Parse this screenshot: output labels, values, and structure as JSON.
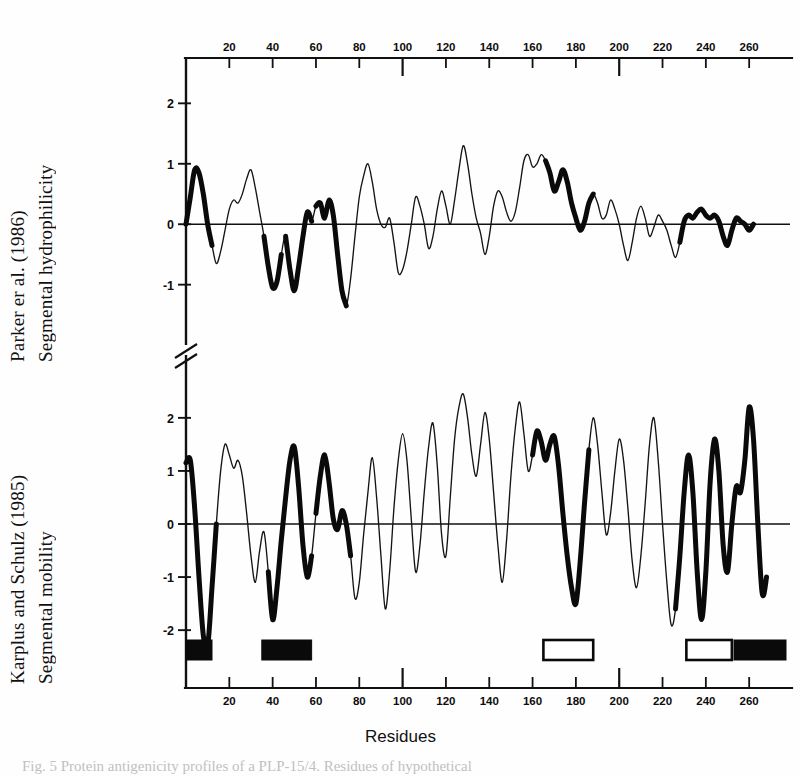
{
  "figure": {
    "xlabel": "Residues",
    "caption": "Fig. 5 Protein antigenicity profiles of a PLP-15/4. Residues of hypothetical",
    "panels": [
      {
        "id": "top",
        "title_line1": "Parker er al. (1986)",
        "title_line2": "Segmental hydrophilicity"
      },
      {
        "id": "bottom",
        "title_line1": "Karplus and Schulz (1985)",
        "title_line2": "Segmental mobility"
      }
    ]
  },
  "chart_data": {
    "type": "line",
    "title": "",
    "xlabel": "Residues",
    "xlim": [
      0,
      277
    ],
    "xticks": [
      20,
      40,
      60,
      80,
      100,
      120,
      140,
      160,
      180,
      200,
      220,
      240,
      260
    ],
    "xtick_labels": [
      "20",
      "40",
      "60",
      "80",
      "100",
      "120",
      "140",
      "160",
      "180",
      "200",
      "220",
      "240",
      "260"
    ],
    "major_xticks": [
      100,
      200
    ],
    "grid": false,
    "legend": "none",
    "axis_break": true,
    "panels": [
      {
        "name": "top",
        "ylabel": "Parker er al. (1986) Segmental hydrophilicity",
        "ylim": [
          -1.75,
          2.75
        ],
        "yticks": [
          -1,
          0,
          1,
          2
        ],
        "ytick_labels": [
          "-1",
          "0",
          "1",
          "2"
        ],
        "zero_line": 0,
        "series": [
          {
            "name": "segmental-hydrophilicity",
            "x": [
              0,
              2,
              4,
              6,
              8,
              10,
              12,
              14,
              16,
              18,
              20,
              22,
              24,
              26,
              28,
              30,
              32,
              34,
              36,
              38,
              40,
              42,
              44,
              46,
              48,
              50,
              52,
              54,
              56,
              58,
              60,
              62,
              64,
              66,
              68,
              70,
              72,
              74,
              76,
              78,
              80,
              82,
              84,
              86,
              88,
              90,
              92,
              94,
              96,
              98,
              100,
              102,
              104,
              106,
              108,
              110,
              112,
              114,
              116,
              118,
              120,
              122,
              124,
              126,
              128,
              130,
              132,
              134,
              136,
              138,
              140,
              142,
              144,
              146,
              148,
              150,
              152,
              154,
              156,
              158,
              160,
              162,
              164,
              166,
              168,
              170,
              172,
              174,
              176,
              178,
              180,
              182,
              184,
              186,
              188,
              190,
              192,
              194,
              196,
              198,
              200,
              202,
              204,
              206,
              208,
              210,
              212,
              214,
              216,
              218,
              220,
              222,
              224,
              226,
              228,
              230,
              232,
              234,
              236,
              238,
              240,
              242,
              244,
              246,
              248,
              250,
              252,
              254,
              256,
              258,
              260,
              262,
              264,
              266,
              268,
              270,
              272,
              274,
              276
            ],
            "y": [
              0.0,
              0.45,
              0.9,
              0.85,
              0.5,
              0.0,
              -0.35,
              -0.65,
              -0.45,
              -0.1,
              0.25,
              0.4,
              0.35,
              0.5,
              0.75,
              0.9,
              0.6,
              0.2,
              -0.2,
              -0.7,
              -1.05,
              -0.95,
              -0.5,
              -0.2,
              -0.75,
              -1.1,
              -0.7,
              -0.2,
              0.2,
              0.05,
              0.3,
              0.35,
              0.1,
              0.4,
              0.15,
              -0.5,
              -1.1,
              -1.35,
              -0.9,
              -0.2,
              0.45,
              0.8,
              1.0,
              0.7,
              0.25,
              0.0,
              -0.05,
              0.1,
              -0.3,
              -0.8,
              -0.75,
              -0.45,
              0.0,
              0.45,
              0.3,
              0.0,
              -0.4,
              -0.2,
              0.25,
              0.55,
              0.3,
              0.0,
              0.4,
              0.9,
              1.3,
              1.0,
              0.5,
              0.1,
              -0.15,
              -0.5,
              -0.2,
              0.3,
              0.55,
              0.45,
              0.2,
              0.05,
              0.2,
              0.6,
              1.05,
              1.15,
              0.95,
              1.0,
              1.15,
              1.05,
              0.85,
              0.55,
              0.7,
              0.9,
              0.7,
              0.35,
              0.1,
              -0.1,
              0.05,
              0.35,
              0.5,
              0.35,
              0.1,
              0.15,
              0.4,
              0.25,
              0.0,
              -0.35,
              -0.6,
              -0.3,
              0.1,
              0.3,
              0.1,
              -0.2,
              -0.05,
              0.15,
              0.05,
              -0.1,
              -0.35,
              -0.55,
              -0.3,
              0.05,
              0.15,
              0.1,
              0.2,
              0.25,
              0.15,
              0.1,
              0.15,
              0.05,
              -0.2,
              -0.35,
              -0.1,
              0.1,
              0.05,
              0.0,
              -0.1,
              0.0,
              0.1
            ],
            "emphasis_ranges": [
              [
                0,
                12
              ],
              [
                36,
                44
              ],
              [
                46,
                58
              ],
              [
                60,
                74
              ],
              [
                166,
                188
              ],
              [
                228,
                276
              ]
            ]
          }
        ]
      },
      {
        "name": "bottom",
        "ylabel": "Karplus and Schulz (1985) Segmental mobility",
        "ylim": [
          -2.6,
          2.6
        ],
        "yticks": [
          -2,
          -1,
          0,
          1,
          2
        ],
        "ytick_labels": [
          "-2",
          "-1",
          "0",
          "1",
          "2"
        ],
        "zero_line": 0,
        "series": [
          {
            "name": "segmental-mobility",
            "x": [
              0,
              2,
              4,
              6,
              8,
              10,
              12,
              14,
              16,
              18,
              20,
              22,
              24,
              26,
              28,
              30,
              32,
              34,
              36,
              38,
              40,
              42,
              44,
              46,
              48,
              50,
              52,
              54,
              56,
              58,
              60,
              62,
              64,
              66,
              68,
              70,
              72,
              74,
              76,
              78,
              80,
              82,
              84,
              86,
              88,
              90,
              92,
              94,
              96,
              98,
              100,
              102,
              104,
              106,
              108,
              110,
              112,
              114,
              116,
              118,
              120,
              122,
              124,
              126,
              128,
              130,
              132,
              134,
              136,
              138,
              140,
              142,
              144,
              146,
              148,
              150,
              152,
              154,
              156,
              158,
              160,
              162,
              164,
              166,
              168,
              170,
              172,
              174,
              176,
              178,
              180,
              182,
              184,
              186,
              188,
              190,
              192,
              194,
              196,
              198,
              200,
              202,
              204,
              206,
              208,
              210,
              212,
              214,
              216,
              218,
              220,
              222,
              224,
              226,
              228,
              230,
              232,
              234,
              236,
              238,
              240,
              242,
              244,
              246,
              248,
              250,
              252,
              254,
              256,
              258,
              260,
              262,
              264,
              266,
              268,
              270,
              272,
              274,
              276
            ],
            "y": [
              1.15,
              1.2,
              0.3,
              -1.0,
              -2.1,
              -2.3,
              -1.2,
              0.0,
              1.0,
              1.5,
              1.3,
              1.05,
              1.2,
              0.9,
              0.2,
              -0.6,
              -1.1,
              -0.5,
              -0.15,
              -0.9,
              -1.8,
              -1.2,
              -0.3,
              0.5,
              1.2,
              1.45,
              0.7,
              -0.4,
              -1.0,
              -0.6,
              0.2,
              0.9,
              1.3,
              0.8,
              0.1,
              -0.1,
              0.25,
              0.0,
              -0.6,
              -1.4,
              -1.1,
              -0.2,
              0.6,
              1.25,
              0.5,
              -0.6,
              -1.6,
              -0.9,
              0.3,
              1.2,
              1.7,
              1.2,
              0.1,
              -0.9,
              -0.4,
              0.6,
              1.45,
              1.9,
              1.1,
              -0.2,
              -0.6,
              0.5,
              1.6,
              2.2,
              2.45,
              2.0,
              1.3,
              0.9,
              1.5,
              2.1,
              1.6,
              0.6,
              -0.4,
              -1.1,
              -0.3,
              0.9,
              1.8,
              2.3,
              1.7,
              1.0,
              1.3,
              1.75,
              1.55,
              1.2,
              1.5,
              1.65,
              1.1,
              0.2,
              -0.6,
              -1.2,
              -1.5,
              -0.7,
              0.4,
              1.4,
              2.0,
              1.5,
              0.6,
              -0.2,
              0.2,
              1.0,
              1.6,
              1.2,
              0.3,
              -0.7,
              -1.2,
              -0.6,
              0.4,
              1.5,
              2.0,
              1.2,
              0.0,
              -1.1,
              -1.9,
              -1.6,
              -0.6,
              0.6,
              1.3,
              0.6,
              -0.9,
              -1.8,
              -0.9,
              0.8,
              1.6,
              1.0,
              -0.4,
              -0.9,
              0.0,
              0.7,
              0.6,
              1.2,
              2.2,
              1.6,
              0.0,
              -1.3,
              -1.0,
              -0.1
            ],
            "emphasis_ranges": [
              [
                0,
                14
              ],
              [
                38,
                58
              ],
              [
                60,
                76
              ],
              [
                160,
                186
              ],
              [
                226,
                276
              ]
            ]
          }
        ]
      }
    ],
    "epitope_bars": [
      {
        "start": 0,
        "end": 12,
        "style": "filled"
      },
      {
        "start": 35,
        "end": 58,
        "style": "filled"
      },
      {
        "start": 165,
        "end": 188,
        "style": "open"
      },
      {
        "start": 231,
        "end": 252,
        "style": "open"
      },
      {
        "start": 253,
        "end": 277,
        "style": "filled"
      }
    ]
  }
}
